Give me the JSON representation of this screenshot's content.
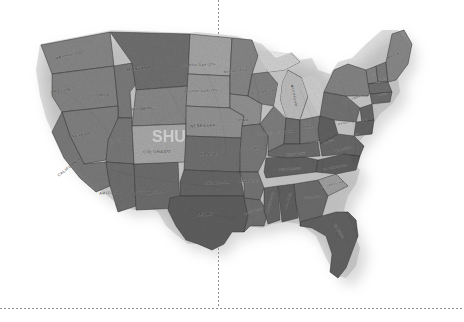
{
  "canvas": {
    "width": 464,
    "height": 322,
    "background": "#ffffff"
  },
  "map": {
    "title": "United States relief map",
    "description": "Grayscale shaded-relief map of the contiguous United States with state boundaries and state name labels, cast on a white background with a soft drop shadow.",
    "style": "grayscale-shaded-relief",
    "projection_look": "albers-like",
    "colors": {
      "background": "#ffffff",
      "land_light": "#d8d8d8",
      "land_mid": "#9a9a9a",
      "land_dark": "#5e5e5e",
      "land_darkest": "#3c3c3c",
      "border_line": "#2b2b2b",
      "label_text": "#1b1b1b",
      "shadow": "#b9b9b9",
      "guide_line": "#8e8e94",
      "watermark": "#ffffff"
    },
    "bounds": {
      "left": 38,
      "top": 28,
      "right": 415,
      "bottom": 283
    }
  },
  "guides": {
    "vertical": {
      "x": 218,
      "top": 0,
      "bottom": 308,
      "style": "dotted"
    },
    "horizontal": {
      "y": 308,
      "left": 0,
      "right": 464,
      "style": "dotted"
    }
  },
  "watermark": {
    "visible": true,
    "text": "SHU",
    "over_state": "COLORADO",
    "opacity": 0.45
  },
  "states": [
    {
      "code": "WA",
      "label": "WASHINGTON",
      "x": 70,
      "y": 56,
      "tone": "#8d8d8d",
      "size": 3.6,
      "rotate": -14
    },
    {
      "code": "OR",
      "label": "OREGON",
      "x": 61,
      "y": 92,
      "tone": "#8a8a8a",
      "size": 3.8,
      "rotate": -8
    },
    {
      "code": "ID",
      "label": "IDAHO",
      "x": 102,
      "y": 96,
      "tone": "#7e7e7e",
      "size": 3.8,
      "rotate": -6
    },
    {
      "code": "MT",
      "label": "MONTANA",
      "x": 139,
      "y": 70,
      "tone": "#6f6f6f",
      "size": 4.2,
      "rotate": -6
    },
    {
      "code": "WY",
      "label": "WYOMING",
      "x": 143,
      "y": 110,
      "tone": "#8f8f8f",
      "size": 3.9,
      "rotate": -4
    },
    {
      "code": "ND",
      "label": "NORTH DAKOTA",
      "x": 199,
      "y": 66,
      "tone": "#b4b4b4",
      "size": 3.4,
      "rotate": -2
    },
    {
      "code": "SD",
      "label": "SOUTH DAKOTA",
      "x": 201,
      "y": 92,
      "tone": "#a6a6a6",
      "size": 3.4,
      "rotate": -2
    },
    {
      "code": "NE",
      "label": "NEBRASKA",
      "x": 203,
      "y": 127,
      "tone": "#9c9c9c",
      "size": 3.8,
      "rotate": -2
    },
    {
      "code": "IA",
      "label": "IOWA",
      "x": 243,
      "y": 121,
      "tone": "#9a9a9a",
      "size": 3.6,
      "rotate": -2
    },
    {
      "code": "CO",
      "label": "COLORADO",
      "x": 157,
      "y": 153,
      "tone": "#b8b8b8",
      "size": 4.0,
      "rotate": -2
    },
    {
      "code": "KS",
      "label": "KANSAS",
      "x": 210,
      "y": 155,
      "tone": "#707070",
      "size": 3.9,
      "rotate": -1
    },
    {
      "code": "MO",
      "label": "MISSOURI",
      "x": 248,
      "y": 150,
      "tone": "#7b7b7b",
      "size": 3.5,
      "rotate": -4
    },
    {
      "code": "NV",
      "label": "NEVADA",
      "x": 81,
      "y": 136,
      "tone": "#858585",
      "size": 3.6,
      "rotate": -10
    },
    {
      "code": "UT",
      "label": "UTAH",
      "x": 116,
      "y": 142,
      "tone": "#7a7a7a",
      "size": 3.5,
      "rotate": -6
    },
    {
      "code": "CA",
      "label": "CALIFORNIA",
      "x": 70,
      "y": 168,
      "tone": "#7d7d7d",
      "size": 3.8,
      "rotate": -38
    },
    {
      "code": "AZ",
      "label": "ARIZONA",
      "x": 110,
      "y": 194,
      "tone": "#6e6e6e",
      "size": 3.8,
      "rotate": -4
    },
    {
      "code": "NM",
      "label": "NEW MEXICO",
      "x": 150,
      "y": 194,
      "tone": "#6c6c6c",
      "size": 3.7,
      "rotate": -3
    },
    {
      "code": "OK",
      "label": "OKLAHOMA",
      "x": 217,
      "y": 184,
      "tone": "#636363",
      "size": 3.6,
      "rotate": -2
    },
    {
      "code": "TX",
      "label": "TEXAS",
      "x": 205,
      "y": 216,
      "tone": "#5a5a5a",
      "size": 4.2,
      "rotate": -2
    },
    {
      "code": "MN",
      "label": "MINNESOTA",
      "x": 236,
      "y": 72,
      "tone": "#8c8c8c",
      "size": 3.2,
      "rotate": -6
    },
    {
      "code": "WI",
      "label": "WISCONSIN",
      "x": 263,
      "y": 93,
      "tone": "#868686",
      "size": 3.1,
      "rotate": -8
    },
    {
      "code": "MI",
      "label": "MICHIGAN",
      "x": 293,
      "y": 96,
      "tone": "#d2d2d2",
      "size": 3.4,
      "rotate": 78
    },
    {
      "code": "IL",
      "label": "ILLINOIS",
      "x": 266,
      "y": 135,
      "tone": "#828282",
      "size": 3.0,
      "rotate": -6
    },
    {
      "code": "IN",
      "label": "INDIANA",
      "x": 286,
      "y": 133,
      "tone": "#6d6d6d",
      "size": 2.9,
      "rotate": -4
    },
    {
      "code": "OH",
      "label": "OHIO",
      "x": 309,
      "y": 128,
      "tone": "#7c7c7c",
      "size": 3.5,
      "rotate": -4
    },
    {
      "code": "KY",
      "label": "KENTUCKY",
      "x": 296,
      "y": 155,
      "tone": "#6a6a6a",
      "size": 2.8,
      "rotate": -6
    },
    {
      "code": "TN",
      "label": "TENNESSEE",
      "x": 290,
      "y": 170,
      "tone": "#5f5f5f",
      "size": 2.8,
      "rotate": -4
    },
    {
      "code": "WV",
      "label": "W. VA.",
      "x": 329,
      "y": 142,
      "tone": "#5d5d5d",
      "size": 2.6,
      "rotate": -20
    },
    {
      "code": "VA",
      "label": "VIRGINIA",
      "x": 344,
      "y": 150,
      "tone": "#666666",
      "size": 2.8,
      "rotate": -16
    },
    {
      "code": "NC",
      "label": "N. CAROLINA",
      "x": 336,
      "y": 168,
      "tone": "#5b5b5b",
      "size": 2.8,
      "rotate": -10
    },
    {
      "code": "SC",
      "label": "S. CAROLINA",
      "x": 333,
      "y": 185,
      "tone": "#adadad",
      "size": 2.6,
      "rotate": -14
    },
    {
      "code": "GA",
      "label": "GEORGIA",
      "x": 313,
      "y": 198,
      "tone": "#6b6b6b",
      "size": 3.0,
      "rotate": -6
    },
    {
      "code": "AL",
      "label": "ALABAMA",
      "x": 289,
      "y": 200,
      "tone": "#5c5c5c",
      "size": 2.8,
      "rotate": -72
    },
    {
      "code": "MS",
      "label": "MISSISSIPPI",
      "x": 271,
      "y": 203,
      "tone": "#636363",
      "size": 2.6,
      "rotate": -74
    },
    {
      "code": "AR",
      "label": "ARKANSAS",
      "x": 249,
      "y": 182,
      "tone": "#767676",
      "size": 2.9,
      "rotate": -4
    },
    {
      "code": "LA",
      "label": "LOUISIANA",
      "x": 254,
      "y": 212,
      "tone": "#6f6f6f",
      "size": 2.7,
      "rotate": -18
    },
    {
      "code": "FL",
      "label": "FLORIDA",
      "x": 338,
      "y": 232,
      "tone": "#5e5e5e",
      "size": 3.0,
      "rotate": 58
    },
    {
      "code": "PA",
      "label": "PENN.",
      "x": 344,
      "y": 124,
      "tone": "#737373",
      "size": 2.7,
      "rotate": -14
    },
    {
      "code": "NY",
      "label": "NEW YORK",
      "x": 352,
      "y": 100,
      "tone": "#8a8a8a",
      "size": 2.9,
      "rotate": -18
    },
    {
      "code": "ME",
      "label": "MAINE",
      "x": 394,
      "y": 56,
      "tone": "#8f8f8f",
      "size": 3.2,
      "rotate": -26
    },
    {
      "code": "VT",
      "label": "VT",
      "x": 374,
      "y": 76,
      "tone": "#8a8a8a",
      "size": 2.4,
      "rotate": -20
    },
    {
      "code": "NH",
      "label": "N.H.",
      "x": 383,
      "y": 80,
      "tone": "#7f7f7f",
      "size": 2.4,
      "rotate": -20
    },
    {
      "code": "MA",
      "label": "MASS.",
      "x": 383,
      "y": 95,
      "tone": "#6f6f6f",
      "size": 2.4,
      "rotate": -12
    },
    {
      "code": "CT",
      "label": "CT",
      "x": 378,
      "y": 105,
      "tone": "#6a6a6a",
      "size": 2.2,
      "rotate": -12
    },
    {
      "code": "NJ",
      "label": "N.J.",
      "x": 365,
      "y": 121,
      "tone": "#646464",
      "size": 2.2,
      "rotate": -14
    },
    {
      "code": "MD",
      "label": "MD.",
      "x": 357,
      "y": 135,
      "tone": "#606060",
      "size": 2.2,
      "rotate": -14
    }
  ]
}
